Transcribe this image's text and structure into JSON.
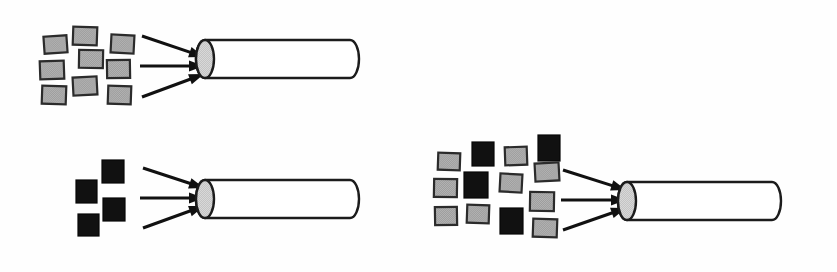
{
  "figure": {
    "title": "",
    "background_color": "#fefefe",
    "width": 837,
    "height": 272
  },
  "palette": {
    "particle_gray_fill": "#a0a0a0",
    "particle_gray_stroke": "#2b2b2b",
    "particle_black_fill": "#111111",
    "tube_fill": "#ffffff",
    "tube_stroke": "#1c1c1c",
    "tube_cap_fill": "#c8c8c8",
    "arrow_color": "#111111"
  },
  "groups": [
    {
      "id": "top-left-group",
      "label": "",
      "particles": [
        {
          "type": "gray",
          "x": 44,
          "y": 36,
          "w": 23,
          "h": 17,
          "rot": -4
        },
        {
          "type": "gray",
          "x": 73,
          "y": 27,
          "w": 24,
          "h": 18,
          "rot": 2
        },
        {
          "type": "gray",
          "x": 111,
          "y": 35,
          "w": 23,
          "h": 18,
          "rot": 3
        },
        {
          "type": "gray",
          "x": 40,
          "y": 61,
          "w": 24,
          "h": 18,
          "rot": -2
        },
        {
          "type": "gray",
          "x": 79,
          "y": 50,
          "w": 24,
          "h": 18,
          "rot": 1
        },
        {
          "type": "gray",
          "x": 107,
          "y": 60,
          "w": 23,
          "h": 18,
          "rot": -1
        },
        {
          "type": "gray",
          "x": 42,
          "y": 86,
          "w": 24,
          "h": 18,
          "rot": 2
        },
        {
          "type": "gray",
          "x": 73,
          "y": 77,
          "w": 24,
          "h": 18,
          "rot": -3
        },
        {
          "type": "gray",
          "x": 108,
          "y": 86,
          "w": 23,
          "h": 18,
          "rot": 2
        }
      ],
      "arrows": [
        {
          "x1": 142,
          "y1": 36,
          "x2": 204,
          "y2": 57
        },
        {
          "x1": 140,
          "y1": 66,
          "x2": 204,
          "y2": 66
        },
        {
          "x1": 142,
          "y1": 97,
          "x2": 204,
          "y2": 74
        }
      ],
      "tube": {
        "x": 205,
        "y": 40,
        "length": 145,
        "height": 38,
        "cap_rx": 9,
        "cap_ry": 19
      },
      "gray_count": 9,
      "black_count": 0
    },
    {
      "id": "middle-left-group",
      "label": "",
      "particles": [
        {
          "type": "black",
          "x": 102,
          "y": 160,
          "w": 22,
          "h": 23,
          "rot": 0
        },
        {
          "type": "black",
          "x": 76,
          "y": 180,
          "w": 21,
          "h": 23,
          "rot": 0
        },
        {
          "type": "black",
          "x": 103,
          "y": 198,
          "w": 22,
          "h": 23,
          "rot": 0
        },
        {
          "type": "black",
          "x": 78,
          "y": 214,
          "w": 21,
          "h": 22,
          "rot": 0
        }
      ],
      "arrows": [
        {
          "x1": 143,
          "y1": 168,
          "x2": 204,
          "y2": 188
        },
        {
          "x1": 140,
          "y1": 198,
          "x2": 204,
          "y2": 198
        },
        {
          "x1": 143,
          "y1": 228,
          "x2": 204,
          "y2": 206
        }
      ],
      "tube": {
        "x": 205,
        "y": 180,
        "length": 145,
        "height": 38,
        "cap_rx": 9,
        "cap_ry": 19
      },
      "gray_count": 0,
      "black_count": 4
    },
    {
      "id": "right-group",
      "label": "",
      "particles": [
        {
          "type": "gray",
          "x": 438,
          "y": 153,
          "w": 22,
          "h": 17,
          "rot": 2
        },
        {
          "type": "black",
          "x": 472,
          "y": 142,
          "w": 22,
          "h": 24,
          "rot": 0
        },
        {
          "type": "gray",
          "x": 505,
          "y": 147,
          "w": 22,
          "h": 18,
          "rot": -2
        },
        {
          "type": "black",
          "x": 538,
          "y": 135,
          "w": 22,
          "h": 26,
          "rot": 0
        },
        {
          "type": "gray",
          "x": 434,
          "y": 179,
          "w": 23,
          "h": 18,
          "rot": 1
        },
        {
          "type": "black",
          "x": 464,
          "y": 172,
          "w": 24,
          "h": 26,
          "rot": 0
        },
        {
          "type": "gray",
          "x": 500,
          "y": 174,
          "w": 22,
          "h": 18,
          "rot": 3
        },
        {
          "type": "gray",
          "x": 535,
          "y": 163,
          "w": 24,
          "h": 18,
          "rot": -3
        },
        {
          "type": "gray",
          "x": 435,
          "y": 207,
          "w": 22,
          "h": 18,
          "rot": -1
        },
        {
          "type": "gray",
          "x": 467,
          "y": 205,
          "w": 22,
          "h": 18,
          "rot": 2
        },
        {
          "type": "gray",
          "x": 530,
          "y": 192,
          "w": 24,
          "h": 19,
          "rot": 1
        },
        {
          "type": "black",
          "x": 500,
          "y": 208,
          "w": 23,
          "h": 26,
          "rot": 0
        },
        {
          "type": "gray",
          "x": 533,
          "y": 219,
          "w": 24,
          "h": 18,
          "rot": 2
        }
      ],
      "arrows": [
        {
          "x1": 563,
          "y1": 170,
          "x2": 626,
          "y2": 190
        },
        {
          "x1": 561,
          "y1": 200,
          "x2": 626,
          "y2": 200
        },
        {
          "x1": 563,
          "y1": 230,
          "x2": 626,
          "y2": 208
        }
      ],
      "tube": {
        "x": 627,
        "y": 182,
        "length": 145,
        "height": 38,
        "cap_rx": 9,
        "cap_ry": 19
      },
      "gray_count": 9,
      "black_count": 4
    }
  ],
  "chart_data": {
    "type": "diagram",
    "title": "",
    "series": [
      {
        "name": "top-left-group",
        "gray_particles": 9,
        "black_particles": 4,
        "total": 9,
        "arrows": 3
      },
      {
        "name": "middle-left-group",
        "gray_particles": 0,
        "black_particles": 4,
        "total": 4,
        "arrows": 3
      },
      {
        "name": "right-group",
        "gray_particles": 9,
        "black_particles": 4,
        "total": 13,
        "arrows": 3
      }
    ],
    "categories": [
      "top-left-group",
      "middle-left-group",
      "right-group"
    ],
    "values": [
      9,
      4,
      13
    ],
    "xlabel": "",
    "ylabel": "",
    "legend": []
  }
}
